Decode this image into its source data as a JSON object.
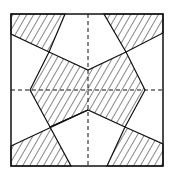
{
  "diagram": {
    "type": "geometric-pattern",
    "stroke_color": "#111111",
    "background": "#ffffff"
  }
}
